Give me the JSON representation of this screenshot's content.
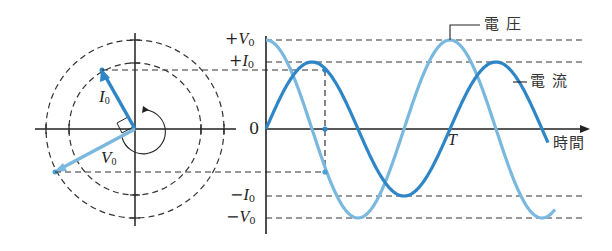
{
  "phasor": {
    "current_label": "I",
    "current_sub": "0",
    "voltage_label": "V",
    "voltage_sub": "0"
  },
  "graph": {
    "y_ticks": {
      "plus_v0_sign": "+",
      "plus_v0": "V",
      "plus_i0_sign": "+",
      "plus_i0": "I",
      "zero": "0",
      "minus_i0_sign": "−",
      "minus_i0": "I",
      "minus_v0_sign": "−",
      "minus_v0": "V",
      "sub": "0"
    },
    "period_label": "T",
    "x_axis_label": "時間",
    "voltage_legend": "電 圧",
    "current_legend": "電 流"
  },
  "colors": {
    "voltage": "#7ab8e0",
    "current": "#2f86c6",
    "axis": "#222222",
    "dash": "#333333"
  }
}
